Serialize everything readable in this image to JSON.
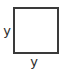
{
  "figure": {
    "kind": "geometry-diagram",
    "shape": "square",
    "width_px": 67,
    "height_px": 73,
    "background_color": "#ffffff",
    "stroke_color": "#3a3a3a",
    "stroke_width_px": 2,
    "fill_color": "#ffffff",
    "square": {
      "x": 14,
      "y": 8,
      "width": 44,
      "height": 45
    },
    "labels": {
      "left_side": {
        "text": "y",
        "x": 7,
        "y": 31,
        "color": "#2b2b2b",
        "font_size_px": 13
      },
      "bottom_side": {
        "text": "y",
        "x": 34,
        "y": 62,
        "color": "#2b2b2b",
        "font_size_px": 13
      }
    }
  }
}
